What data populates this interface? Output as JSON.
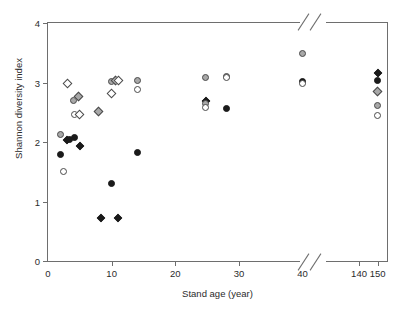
{
  "chart_data": {
    "type": "scatter",
    "title": "",
    "xlabel": "Stand age (year)",
    "ylabel": "Shannon diversity index",
    "xlim": [
      0,
      155
    ],
    "ylim": [
      0,
      4
    ],
    "grid": false,
    "legend": "none",
    "axis_break": {
      "axis": "x",
      "from": 45,
      "to": 135,
      "note": "x-axis broken between 40 and 140 (double slash marks on top and bottom frame)"
    },
    "xticks": [
      {
        "value": 0,
        "label": "0"
      },
      {
        "value": 10,
        "label": "10"
      },
      {
        "value": 20,
        "label": "20"
      },
      {
        "value": 30,
        "label": "30"
      },
      {
        "value": 40,
        "label": "40"
      },
      {
        "value": 140,
        "label": "140"
      },
      {
        "value": 150,
        "label": "150"
      }
    ],
    "yticks": [
      {
        "value": 0,
        "label": "0"
      },
      {
        "value": 1,
        "label": "1"
      },
      {
        "value": 2,
        "label": "2"
      },
      {
        "value": 3,
        "label": "3"
      },
      {
        "value": 4,
        "label": "4"
      }
    ],
    "marker_styles": [
      "open-circle",
      "gray-circle",
      "filled-circle",
      "open-diamond",
      "gray-diamond",
      "filled-diamond"
    ],
    "points": [
      {
        "x": 2,
        "y": 2.13,
        "style": "gray-circle"
      },
      {
        "x": 2,
        "y": 1.79,
        "style": "filled-circle"
      },
      {
        "x": 2.5,
        "y": 1.51,
        "style": "open-circle"
      },
      {
        "x": 3,
        "y": 2.98,
        "style": "open-diamond"
      },
      {
        "x": 3,
        "y": 2.04,
        "style": "filled-diamond"
      },
      {
        "x": 3.3,
        "y": 2.05,
        "style": "filled-circle"
      },
      {
        "x": 4,
        "y": 2.7,
        "style": "gray-circle"
      },
      {
        "x": 4.1,
        "y": 2.47,
        "style": "open-circle"
      },
      {
        "x": 4.2,
        "y": 2.07,
        "style": "filled-circle"
      },
      {
        "x": 4.8,
        "y": 2.76,
        "style": "gray-diamond"
      },
      {
        "x": 4.9,
        "y": 2.47,
        "style": "open-diamond"
      },
      {
        "x": 5.1,
        "y": 1.94,
        "style": "filled-diamond"
      },
      {
        "x": 8,
        "y": 2.51,
        "style": "gray-diamond"
      },
      {
        "x": 8.3,
        "y": 0.73,
        "style": "filled-diamond"
      },
      {
        "x": 10,
        "y": 3.01,
        "style": "gray-circle"
      },
      {
        "x": 10,
        "y": 2.82,
        "style": "open-diamond"
      },
      {
        "x": 10,
        "y": 1.3,
        "style": "filled-circle"
      },
      {
        "x": 10.6,
        "y": 3.04,
        "style": "gray-diamond"
      },
      {
        "x": 11,
        "y": 3.04,
        "style": "open-diamond"
      },
      {
        "x": 11,
        "y": 0.73,
        "style": "filled-diamond"
      },
      {
        "x": 14,
        "y": 3.04,
        "style": "gray-circle"
      },
      {
        "x": 14,
        "y": 2.89,
        "style": "open-circle"
      },
      {
        "x": 14,
        "y": 1.83,
        "style": "filled-circle"
      },
      {
        "x": 24.8,
        "y": 3.08,
        "style": "gray-circle"
      },
      {
        "x": 24.8,
        "y": 2.69,
        "style": "filled-diamond"
      },
      {
        "x": 24.8,
        "y": 2.64,
        "style": "gray-circle"
      },
      {
        "x": 24.8,
        "y": 2.58,
        "style": "open-circle"
      },
      {
        "x": 28,
        "y": 3.1,
        "style": "gray-circle"
      },
      {
        "x": 28,
        "y": 3.08,
        "style": "open-circle"
      },
      {
        "x": 28,
        "y": 2.56,
        "style": "filled-circle"
      },
      {
        "x": 40,
        "y": 3.48,
        "style": "gray-circle"
      },
      {
        "x": 40,
        "y": 3.01,
        "style": "filled-circle"
      },
      {
        "x": 40,
        "y": 2.98,
        "style": "open-circle"
      },
      {
        "x": 150,
        "y": 3.16,
        "style": "filled-diamond"
      },
      {
        "x": 150,
        "y": 3.03,
        "style": "filled-circle"
      },
      {
        "x": 150,
        "y": 2.85,
        "style": "gray-diamond"
      },
      {
        "x": 150,
        "y": 2.62,
        "style": "gray-circle"
      },
      {
        "x": 150,
        "y": 2.45,
        "style": "open-circle"
      }
    ]
  }
}
